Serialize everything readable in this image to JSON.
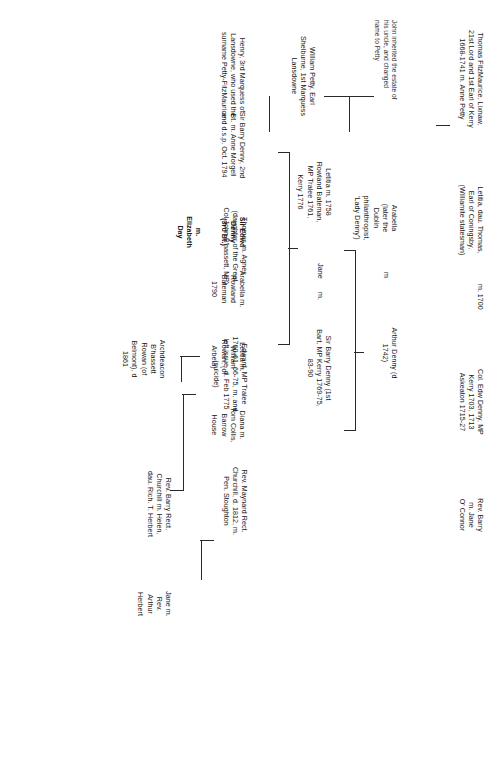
{
  "document": {
    "kind": "genealogy-chart",
    "orientation": "rotated-90-clockwise",
    "title": "Denny / FitzMaurice / Petty family tree"
  },
  "nodes": {
    "thomas_fitzmaurice": "Thomas FitzMaurice, Lixnaw,\n21st Lord and 1st Earl of Kerry\n1668-1741 m. Anne Petty",
    "letitia_coningsby": "Letitia, dau. Thomas,\nEarl of Coningsby,\n(Williamite statesman)",
    "m_1700": "m.   1700",
    "col_edw_denny": "Col. Edw Denny, MP\nKerry 1703, 1713\nAskeaton 1715-27",
    "john_note": "John inherited the estate of\nhis uncle, and changed\nname to Petty",
    "william_petty": "William Petty, Earl\nShelburne, 1st Marquess\nLansdowne",
    "henry_lansdowne": "Henry, 3rd Marquess of\nLansdowne, who used the\nsurname Petty-FitzMaurice",
    "arabella": "Arabella\n(later the\nDublin\nphilanthropist,\n'Lady Denny')",
    "m_arabella": "m",
    "arthur_denny": "Arthur Denny (d\n1742)",
    "rev_barry": "Rev. Barry\nm. Jane\nO' Connor",
    "letitia_1758": "Letitia m. 1758\nRowland Bateman,\nMP Tralee 1761,\nKerry 1776",
    "jane": "Jane",
    "m_jane": "m.",
    "sir_barry_denny_1": "Sir Barry Denny (1st\nBart, MP Kerry 1769-75,\n83-90",
    "thomas_agnes": "Thomas m. Agnes\n(daughter of the Great\nCol John B'hassett, MP)",
    "edward_maynard": "Edward, MP Tralee\n1760-61, 66-75, m. and\nleft issue, d. Feb 1775\n(suicide)",
    "rev_maynard": "Rev. Maynard Rect.\nChurchill, d. 1812, m.\nPen. Stoughton",
    "sir_barry_denny_2": "Sir Barry Denny, 2nd\nBt. m. Anne Morgell\nand d.s.p. Oct. 1794",
    "sir_edwd_denny": "Sir Edwd\nDenny\n(3rd Bt.)",
    "elizabeth_day": "m.\nElizabeth\nDay",
    "arabella_bateman": "Arabella m.\nRowland\nBateman\n1790",
    "letitia_rowan": "Letitia m.\nWilliam\nRowan, (of\nArbela)",
    "diana_collis": "Diana m.\nTom Collis,\nBarrow\nHouse",
    "rev_barry_rect": "Rev. Barry Rect.\nChurchill m. Helen,\ndau. Rich. T. Herbert",
    "jane_herbert": "Jane m.\nRev.\nArthur\nHerbert",
    "archdeacon": "Archdeacon\nB'hassett\nRowan (of\nBelmont), d\n1861"
  }
}
